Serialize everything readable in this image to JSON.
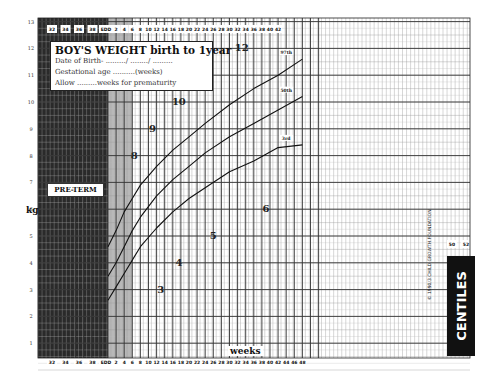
{
  "chart_data": {
    "type": "line",
    "title": "BOY'S WEIGHT birth to 1year",
    "xlabel": "weeks",
    "ylabel": "kg",
    "xlim": [
      -8,
      52
    ],
    "ylim": [
      0,
      13
    ],
    "grid": true,
    "x_ticks_preterm": [
      "32",
      "34",
      "36",
      "38",
      "EDD"
    ],
    "x_ticks": [
      "2",
      "4",
      "6",
      "8",
      "10",
      "12",
      "14",
      "16",
      "18",
      "20",
      "22",
      "24",
      "26",
      "28",
      "30",
      "32",
      "34",
      "36",
      "38",
      "40",
      "42",
      "44",
      "46",
      "48",
      "50",
      "52"
    ],
    "y_ticks": [
      "1",
      "2",
      "3",
      "4",
      "5",
      "6",
      "7",
      "8",
      "9",
      "10",
      "11",
      "12",
      "13"
    ],
    "x": [
      0,
      2,
      4,
      6,
      8,
      12,
      16,
      20,
      24,
      30,
      36,
      42,
      48
    ],
    "series": [
      {
        "name": "97th",
        "values": [
          4.6,
          5.2,
          5.9,
          6.4,
          6.9,
          7.6,
          8.2,
          8.7,
          9.2,
          9.9,
          10.5,
          11.0,
          11.6
        ]
      },
      {
        "name": "50th",
        "values": [
          3.5,
          4.0,
          4.6,
          5.2,
          5.7,
          6.5,
          7.1,
          7.6,
          8.1,
          8.7,
          9.2,
          9.7,
          10.2
        ]
      },
      {
        "name": "3rd",
        "values": [
          2.6,
          3.1,
          3.6,
          4.1,
          4.6,
          5.3,
          5.9,
          6.4,
          6.8,
          7.4,
          7.8,
          8.3,
          8.4
        ]
      }
    ],
    "month_markers": [
      {
        "label": "3",
        "week": 13,
        "kg": 3.0
      },
      {
        "label": "4",
        "week": 17.5,
        "kg": 4.0
      },
      {
        "label": "5",
        "week": 26,
        "kg": 5.0
      },
      {
        "label": "6",
        "week": 39,
        "kg": 6.0
      },
      {
        "label": "8",
        "week": 6.5,
        "kg": 8.0
      },
      {
        "label": "9",
        "week": 11,
        "kg": 9.0
      },
      {
        "label": "10",
        "week": 17.5,
        "kg": 10.0
      },
      {
        "label": "11",
        "week": 22.5,
        "kg": 11.0
      },
      {
        "label": "12",
        "week": 33,
        "kg": 12.0
      }
    ],
    "annotations": [
      "PRE-TERM",
      "CENTILES"
    ]
  },
  "title_box": {
    "title": "BOY'S WEIGHT birth to 1year",
    "line1": "Date of Birth- ........./ ......../ .........",
    "line2": "Gestational age ..........(weeks)",
    "line3": "Allow .........weeks for prematurity"
  },
  "labels": {
    "preterm": "PRE-TERM",
    "kg": "kg",
    "weeks": "weeks",
    "centiles": "CENTILES",
    "copyright": "© 1990/3 CHILD GROWTH FOUNDATION",
    "curve_97": "97th",
    "curve_50": "50th",
    "curve_3": "3rd",
    "extra_50": "50",
    "extra_52": "52"
  }
}
